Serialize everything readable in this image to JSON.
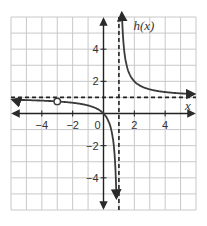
{
  "chart_data": {
    "type": "line",
    "title": "",
    "function_label": "h(x)",
    "xlabel": "x",
    "ylabel": "h(x)",
    "xlim": [
      -6,
      6
    ],
    "ylim": [
      -6,
      6
    ],
    "grid": true,
    "x_ticks": [
      -4,
      -2,
      2,
      4
    ],
    "x_tick_labels": [
      "−4",
      "−2",
      "2",
      "4"
    ],
    "y_ticks": [
      4,
      2,
      -2,
      -4
    ],
    "y_tick_labels": [
      "4",
      "2",
      "−2",
      "−4"
    ],
    "origin_label": "0",
    "asymptotes": {
      "vertical": {
        "x": 1,
        "style": "dashed"
      },
      "horizontal": {
        "y": 1,
        "style": "dashed"
      }
    },
    "series": [
      {
        "name": "left branch",
        "x": [
          -6,
          -5,
          -4,
          -3,
          -2,
          -1,
          0,
          0.5,
          0.8
        ],
        "values": [
          0.86,
          0.83,
          0.8,
          0.75,
          0.67,
          0.5,
          0.0,
          -1.0,
          -4.0
        ]
      },
      {
        "name": "right branch",
        "x": [
          1.17,
          1.5,
          2,
          3,
          4,
          5,
          6
        ],
        "values": [
          7.0,
          3.0,
          2.0,
          1.5,
          1.33,
          1.25,
          1.2
        ]
      }
    ],
    "open_points": [
      {
        "x": -3,
        "y": 0.75
      }
    ]
  },
  "colors": {
    "grid": "#c8c8c8",
    "axis": "#222222",
    "curve": "#3a3a3a",
    "asymptote": "#222222"
  }
}
